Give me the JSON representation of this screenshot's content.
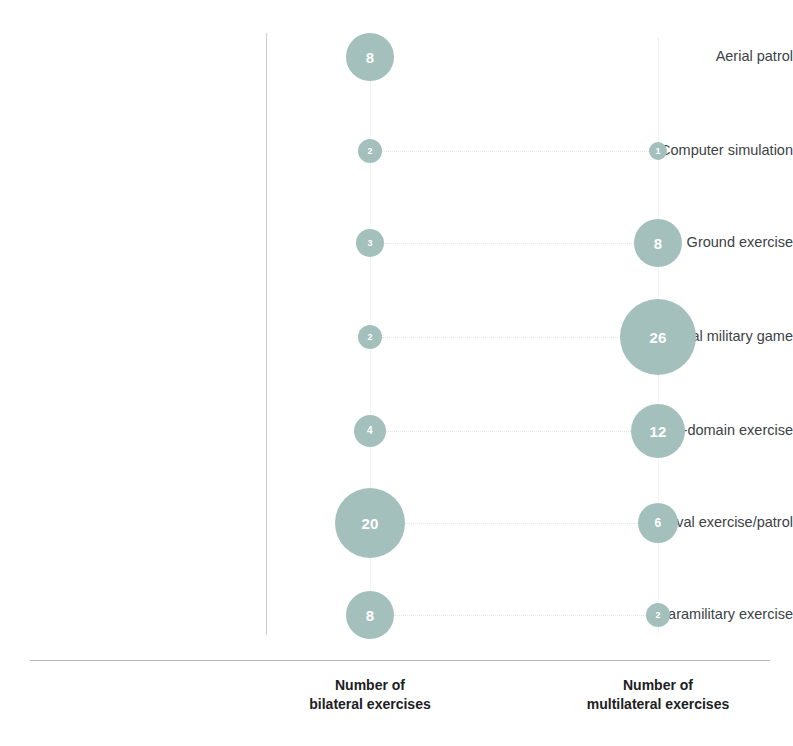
{
  "figure": {
    "clipped_title_fragment": "",
    "bubble_color": "#a3c0bd",
    "value_text_color": "#ffffff",
    "label_text_color": "#3d4245",
    "header_text_color": "#1d2124",
    "divider_color": "#c9cdcf",
    "rule_color": "#b9bdc0",
    "guide_color": "#e3ebea"
  },
  "columns": [
    {
      "id": "bilateral",
      "line1": "Number of",
      "line2": "bilateral exercises"
    },
    {
      "id": "multilateral",
      "line1": "Number of",
      "line2": "multilateral exercises"
    }
  ],
  "chart_data": {
    "type": "scatter",
    "subtype": "connected-bubble / dumbbell",
    "title": "",
    "xlabel": "",
    "ylabel": "",
    "grid": "dotted column guides and dotted row connectors",
    "legend": "none",
    "x": [
      "Number of bilateral exercises",
      "Number of multilateral exercises"
    ],
    "categories": [
      "Aerial patrol",
      "Computer simulation",
      "Ground exercise",
      "International military game",
      "Multi-domain exercise",
      "Naval exercise/patrol",
      "Paramilitary exercise"
    ],
    "series": [
      {
        "name": "Number of bilateral exercises",
        "values": [
          8,
          2,
          3,
          2,
          4,
          20,
          8
        ]
      },
      {
        "name": "Number of multilateral exercises",
        "values": [
          0,
          1,
          8,
          26,
          12,
          6,
          2
        ]
      }
    ],
    "points": [
      {
        "category": "Aerial patrol",
        "bilateral": 8,
        "multilateral": null
      },
      {
        "category": "Computer simulation",
        "bilateral": 2,
        "multilateral": 1
      },
      {
        "category": "Ground exercise",
        "bilateral": 3,
        "multilateral": 8
      },
      {
        "category": "International military game",
        "bilateral": 2,
        "multilateral": 26
      },
      {
        "category": "Multi-domain exercise",
        "bilateral": 4,
        "multilateral": 12
      },
      {
        "category": "Naval exercise/patrol",
        "bilateral": 20,
        "multilateral": 6
      },
      {
        "category": "Paramilitary exercise",
        "bilateral": 8,
        "multilateral": 2
      }
    ],
    "value_range": [
      1,
      26
    ]
  },
  "rows": [
    {
      "label": "Aerial patrol",
      "cy": 57,
      "bilateral": {
        "value": "8",
        "r": 24,
        "show": true
      },
      "multilateral": {
        "value": "",
        "r": 0,
        "show": false
      }
    },
    {
      "label": "Computer simulation",
      "cy": 151,
      "bilateral": {
        "value": "2",
        "r": 12,
        "show": true
      },
      "multilateral": {
        "value": "1",
        "r": 9,
        "show": true
      }
    },
    {
      "label": "Ground exercise",
      "cy": 243,
      "bilateral": {
        "value": "3",
        "r": 14,
        "show": true
      },
      "multilateral": {
        "value": "8",
        "r": 24,
        "show": true
      }
    },
    {
      "label": "International military game",
      "cy": 337,
      "bilateral": {
        "value": "2",
        "r": 12,
        "show": true
      },
      "multilateral": {
        "value": "26",
        "r": 38,
        "show": true
      }
    },
    {
      "label": "Multi-domain exercise",
      "cy": 431,
      "bilateral": {
        "value": "4",
        "r": 16,
        "show": true
      },
      "multilateral": {
        "value": "12",
        "r": 27,
        "show": true
      }
    },
    {
      "label": "Naval exercise/patrol",
      "cy": 523,
      "bilateral": {
        "value": "20",
        "r": 35,
        "show": true
      },
      "multilateral": {
        "value": "6",
        "r": 20,
        "show": true
      }
    },
    {
      "label": "Paramilitary exercise",
      "cy": 615,
      "bilateral": {
        "value": "8",
        "r": 24,
        "show": true
      },
      "multilateral": {
        "value": "2",
        "r": 12,
        "show": true
      }
    }
  ]
}
